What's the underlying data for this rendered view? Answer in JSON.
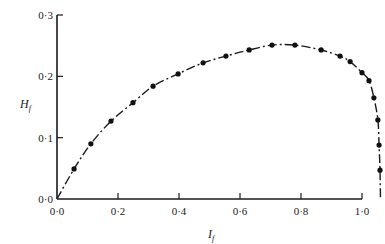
{
  "chart_data": {
    "type": "line",
    "title": "",
    "xlabel": "I_f",
    "ylabel": "H_f",
    "xlabel_main": "I",
    "xlabel_sub": "f",
    "ylabel_main": "H",
    "ylabel_sub": "f",
    "xlim": [
      0.0,
      1.0
    ],
    "ylim": [
      0.0,
      0.3
    ],
    "x_ticks": [
      0.0,
      0.2,
      0.4,
      0.6,
      0.8,
      1.0
    ],
    "x_tick_labels": [
      "0·0",
      "0·2",
      "0·4",
      "0·6",
      "0·8",
      "1·0"
    ],
    "y_ticks": [
      0.0,
      0.1,
      0.2,
      0.3
    ],
    "y_tick_labels": [
      "0·0",
      "0·1",
      "0·2",
      "0·3"
    ],
    "grid": false,
    "legend": null,
    "line_style": "dash-dot curve through markers, starting at origin (0,0) and ending at (1.0,0.0)",
    "series": [
      {
        "name": "H_f vs I_f",
        "marker": "filled circle",
        "x": [
          0.056,
          0.111,
          0.177,
          0.249,
          0.315,
          0.397,
          0.479,
          0.554,
          0.63,
          0.705,
          0.78,
          0.866,
          0.928,
          0.961,
          1.0,
          1.023,
          1.039,
          1.052,
          1.056,
          1.059
        ],
        "y": [
          0.049,
          0.09,
          0.127,
          0.157,
          0.184,
          0.204,
          0.222,
          0.233,
          0.243,
          0.251,
          0.251,
          0.243,
          0.233,
          0.224,
          0.206,
          0.193,
          0.165,
          0.129,
          0.088,
          0.047
        ]
      }
    ]
  },
  "axes": {
    "x_label_main": "I",
    "x_label_sub": "f",
    "y_label_main": "H",
    "y_label_sub": "f"
  }
}
